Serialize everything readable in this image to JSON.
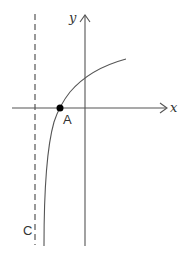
{
  "diagram": {
    "type": "function-graph",
    "axes": {
      "x_label": "x",
      "y_label": "y"
    },
    "point": {
      "label": "A",
      "description": "x-intercept of curve"
    },
    "asymptote": {
      "label": "C",
      "style": "dashed vertical line"
    },
    "curve": {
      "shape": "logarithmic-type increasing curve with vertical asymptote left of y-axis"
    },
    "colors": {
      "stroke": "#555555",
      "point": "#000000",
      "text": "#333333"
    }
  }
}
